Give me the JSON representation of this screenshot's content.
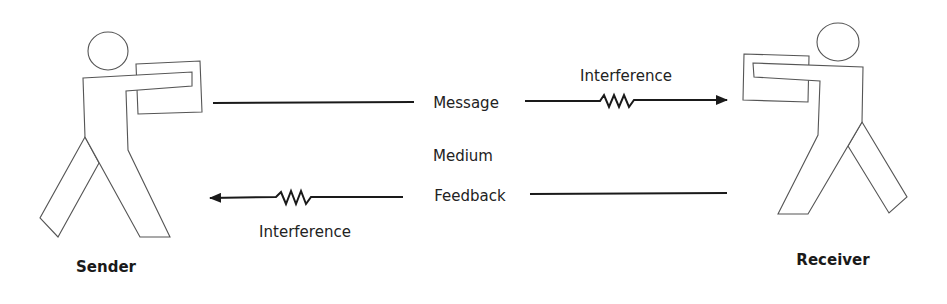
{
  "diagram": {
    "type": "communication-model",
    "colors": {
      "stroke": "#1a1a1a",
      "figure_outline": "#555555",
      "figure_fill": "#ffffff",
      "background": "#ffffff"
    },
    "nodes": {
      "sender": {
        "label": "Sender",
        "icon": "person-holding-box-icon"
      },
      "receiver": {
        "label": "Receiver",
        "icon": "person-holding-box-icon"
      }
    },
    "channel": {
      "medium_label": "Medium"
    },
    "edges": {
      "message": {
        "label": "Message",
        "direction": "sender-to-receiver",
        "interference_label": "Interference"
      },
      "feedback": {
        "label": "Feedback",
        "direction": "receiver-to-sender",
        "interference_label": "Interference"
      }
    }
  }
}
